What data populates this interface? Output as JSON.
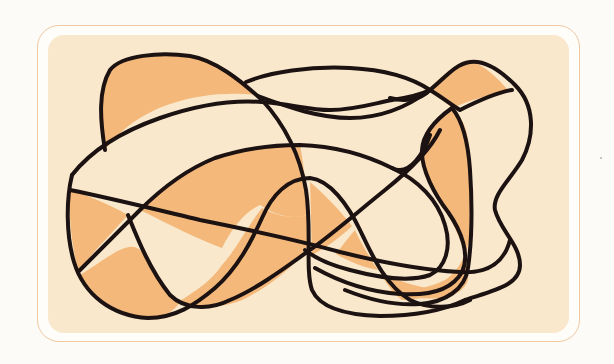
{
  "illustration": {
    "title": "",
    "description_label": "Abstract tangled line art",
    "colors": {
      "page_background": "#fcfbf8",
      "frame_stroke": "#efc9a2",
      "frame_fill": "#fffdf9",
      "panel_fill": "#f9e8cc",
      "region_fill": "#f4b97a",
      "line_stroke": "#1c1212"
    },
    "stroke_width": 4,
    "curve_count": 5,
    "filled_region_count": 12
  }
}
